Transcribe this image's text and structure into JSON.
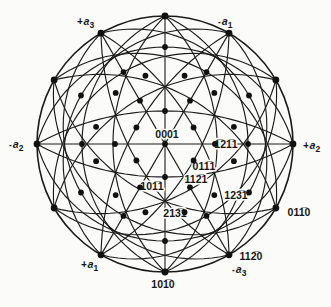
{
  "figure": {
    "background": "#fbfbf9",
    "line_color": "#1b1b1b",
    "dot_color": "#111111",
    "center": {
      "x": 165,
      "y": 144
    },
    "radius": 128,
    "rim_dot_azimuths": [
      0,
      30,
      60,
      90,
      120,
      150,
      180,
      210,
      240,
      270,
      300,
      330
    ],
    "diameter_azimuths": [
      0,
      60,
      90,
      120
    ],
    "arc_families": [
      {
        "pair_azimuths": [
          30,
          90,
          150
        ],
        "bows": [
          52,
          83
        ]
      },
      {
        "pair_azimuths": [
          0,
          60,
          120
        ],
        "bows": [
          33,
          97
        ]
      }
    ],
    "pole_rings": [
      {
        "r": 33,
        "azimuths": [
          30,
          90,
          150,
          210,
          270,
          330
        ]
      },
      {
        "r": 50,
        "azimuths": [
          0,
          60,
          120,
          180,
          240,
          300
        ]
      },
      {
        "r": 71,
        "azimuths": [
          14,
          46,
          74,
          106,
          134,
          166,
          194,
          226,
          254,
          286,
          314,
          346
        ]
      },
      {
        "r": 83,
        "azimuths": [
          0,
          60,
          120,
          180,
          240,
          300
        ]
      },
      {
        "r": 97,
        "azimuths": [
          30,
          90,
          150,
          210,
          270,
          330
        ]
      }
    ],
    "rim_dot_radius": 3.4,
    "pole_dot_radius": 2.9
  },
  "poles": {
    "p0001": "0001",
    "p1011": "101̅1",
    "p0111": "011̅1",
    "p1121": "112̅1",
    "p1211": "1̅21̅1",
    "p1231": "123̅1",
    "p2131": "213̅1",
    "p1010": "101̅0",
    "p0110": "011̅0",
    "p1120": "112̅0"
  },
  "axes": {
    "pa3": {
      "sign": "+",
      "letter": "a",
      "sub": "3"
    },
    "na1": {
      "sign": "-",
      "letter": "a",
      "sub": "1"
    },
    "na2": {
      "sign": "-",
      "letter": "a",
      "sub": "2"
    },
    "pa2": {
      "sign": "+",
      "letter": "a",
      "sub": "2"
    },
    "pa1": {
      "sign": "+",
      "letter": "a",
      "sub": "1"
    },
    "na3": {
      "sign": "-",
      "letter": "a",
      "sub": "3"
    }
  }
}
